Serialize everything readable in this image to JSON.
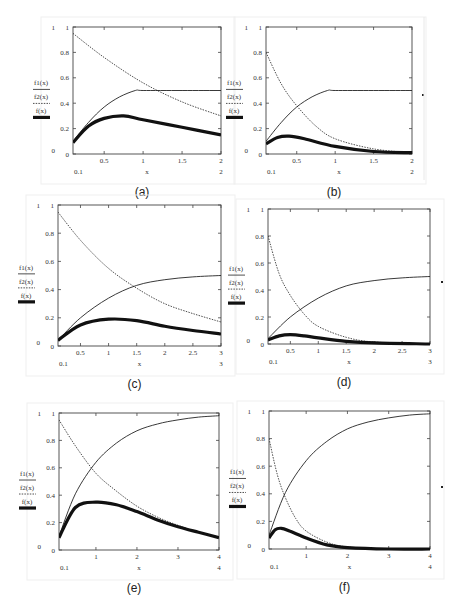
{
  "legend": {
    "f1": "f1(x)",
    "f2": "f2(x)",
    "f": "f(x)"
  },
  "panels": [
    {
      "id": "a",
      "caption": "(a)",
      "frame": [
        73,
        27,
        221,
        154
      ],
      "xmin": 0.1,
      "xmax": 2,
      "xticks": [
        0.5,
        1,
        1.5,
        2
      ],
      "xlabel": "x",
      "xmin_label": "0.1",
      "xmax_label": "2",
      "dot": null,
      "sep_x": null
    },
    {
      "id": "b",
      "caption": "(b)",
      "frame": [
        266,
        27,
        412,
        154
      ],
      "xmin": 0.1,
      "xmax": 2,
      "xticks": [
        0.5,
        1,
        1.5,
        2
      ],
      "xlabel": "x",
      "xmin_label": "0.1",
      "xmax_label": "2",
      "dot": [
        423,
        95
      ],
      "sep_x": 424
    },
    {
      "id": "c",
      "caption": "(c)",
      "frame": [
        58,
        205,
        221,
        346
      ],
      "xmin": 0.1,
      "xmax": 3,
      "xticks": [
        0.5,
        1,
        1.5,
        2,
        2.5,
        3
      ],
      "xlabel": "x",
      "xmin_label": "0.1",
      "xmax_label": "3",
      "dot": null,
      "sep_x": null
    },
    {
      "id": "d",
      "caption": "(d)",
      "frame": [
        268,
        209,
        430,
        344
      ],
      "xmin": 0.1,
      "xmax": 3,
      "xticks": [
        0.5,
        1,
        1.5,
        2,
        2.5,
        3
      ],
      "xlabel": "x",
      "xmin_label": "0.1",
      "xmax_label": "3",
      "dot": [
        442,
        282
      ],
      "sep_x": null
    },
    {
      "id": "e",
      "caption": "(e)",
      "frame": [
        59,
        413,
        219,
        550
      ],
      "xmin": 0.1,
      "xmax": 4,
      "xticks": [
        1,
        2,
        3,
        4
      ],
      "xlabel": "x",
      "xmin_label": "0.1",
      "xmax_label": "4",
      "dot": null,
      "sep_x": null
    },
    {
      "id": "f",
      "caption": "(f)",
      "frame": [
        269,
        411,
        430,
        549
      ],
      "xmin": 0.1,
      "xmax": 4,
      "xticks": [
        1,
        2,
        3,
        4
      ],
      "xlabel": "x",
      "xmin_label": "0.1",
      "xmax_label": "4",
      "dot": [
        442,
        487
      ],
      "sep_x": null
    }
  ],
  "chart_data": [
    {
      "panel": "a",
      "type": "line",
      "title": "(a)",
      "xlabel": "x",
      "ylabel": "",
      "xlim": [
        0.1,
        2
      ],
      "ylim": [
        0,
        1
      ],
      "yticks": [
        0,
        0.2,
        0.4,
        0.6,
        0.8,
        1
      ],
      "xticks": [
        0.5,
        1,
        1.5,
        2
      ],
      "legend": [
        "f1(x)",
        "f2(x)",
        "f(x)"
      ],
      "legend_position": "left",
      "series": [
        {
          "name": "f1(x)",
          "style": "solid-thin",
          "x": [
            0.1,
            0.3,
            0.5,
            0.7,
            0.9,
            1.0,
            1.5,
            2.0
          ],
          "y": [
            0.1,
            0.25,
            0.37,
            0.45,
            0.5,
            0.5,
            0.5,
            0.5
          ]
        },
        {
          "name": "f2(x)",
          "style": "dotted",
          "x": [
            0.1,
            0.5,
            1.0,
            1.5,
            2.0
          ],
          "y": [
            0.95,
            0.76,
            0.56,
            0.41,
            0.3
          ]
        },
        {
          "name": "f(x)",
          "style": "solid-thick",
          "x": [
            0.1,
            0.3,
            0.5,
            0.75,
            1.0,
            1.5,
            2.0
          ],
          "y": [
            0.09,
            0.22,
            0.28,
            0.3,
            0.27,
            0.21,
            0.15
          ]
        }
      ]
    },
    {
      "panel": "b",
      "type": "line",
      "title": "(b)",
      "xlabel": "x",
      "ylabel": "",
      "xlim": [
        0.1,
        2
      ],
      "ylim": [
        0,
        1
      ],
      "yticks": [
        0,
        0.2,
        0.4,
        0.6,
        0.8,
        1
      ],
      "xticks": [
        0.5,
        1,
        1.5,
        2
      ],
      "legend": [
        "f1(x)",
        "f2(x)",
        "f(x)"
      ],
      "legend_position": "left",
      "series": [
        {
          "name": "f1(x)",
          "style": "solid-thin",
          "x": [
            0.1,
            0.3,
            0.5,
            0.7,
            0.9,
            1.0,
            1.5,
            2.0
          ],
          "y": [
            0.1,
            0.25,
            0.37,
            0.45,
            0.5,
            0.5,
            0.5,
            0.5
          ]
        },
        {
          "name": "f2(x)",
          "style": "dotted",
          "x": [
            0.1,
            0.3,
            0.5,
            0.75,
            1.0,
            1.5,
            2.0
          ],
          "y": [
            0.8,
            0.55,
            0.38,
            0.22,
            0.12,
            0.04,
            0.01
          ]
        },
        {
          "name": "f(x)",
          "style": "solid-thick",
          "x": [
            0.1,
            0.25,
            0.4,
            0.6,
            1.0,
            1.5,
            2.0
          ],
          "y": [
            0.08,
            0.13,
            0.14,
            0.12,
            0.06,
            0.02,
            0.01
          ]
        }
      ]
    },
    {
      "panel": "c",
      "type": "line",
      "title": "(c)",
      "xlabel": "x",
      "ylabel": "",
      "xlim": [
        0.1,
        3
      ],
      "ylim": [
        0,
        1
      ],
      "yticks": [
        0,
        0.2,
        0.4,
        0.6,
        0.8,
        1
      ],
      "xticks": [
        0.5,
        1,
        1.5,
        2,
        2.5,
        3
      ],
      "legend": [
        "f1(x)",
        "f2(x)",
        "f(x)"
      ],
      "legend_position": "left",
      "series": [
        {
          "name": "f1(x)",
          "style": "solid-thin",
          "x": [
            0.1,
            0.5,
            1.0,
            1.5,
            2.0,
            2.5,
            3.0
          ],
          "y": [
            0.04,
            0.2,
            0.34,
            0.43,
            0.47,
            0.49,
            0.5
          ]
        },
        {
          "name": "f2(x)",
          "style": "dotted",
          "x": [
            0.1,
            0.5,
            1.0,
            1.5,
            2.0,
            2.5,
            3.0
          ],
          "y": [
            0.95,
            0.75,
            0.55,
            0.41,
            0.3,
            0.23,
            0.17
          ]
        },
        {
          "name": "f(x)",
          "style": "solid-thick",
          "x": [
            0.1,
            0.5,
            1.0,
            1.5,
            2.0,
            2.5,
            3.0
          ],
          "y": [
            0.04,
            0.15,
            0.19,
            0.18,
            0.14,
            0.11,
            0.085
          ]
        }
      ]
    },
    {
      "panel": "d",
      "type": "line",
      "title": "(d)",
      "xlabel": "x",
      "ylabel": "",
      "xlim": [
        0.1,
        3
      ],
      "ylim": [
        0,
        1
      ],
      "yticks": [
        0,
        0.2,
        0.4,
        0.6,
        0.8,
        1
      ],
      "xticks": [
        0.5,
        1,
        1.5,
        2,
        2.5,
        3
      ],
      "legend": [
        "f1(x)",
        "f2(x)",
        "f(x)"
      ],
      "legend_position": "left",
      "series": [
        {
          "name": "f1(x)",
          "style": "solid-thin",
          "x": [
            0.1,
            0.5,
            1.0,
            1.5,
            2.0,
            2.5,
            3.0
          ],
          "y": [
            0.04,
            0.2,
            0.34,
            0.43,
            0.47,
            0.49,
            0.5
          ]
        },
        {
          "name": "f2(x)",
          "style": "dotted",
          "x": [
            0.1,
            0.3,
            0.5,
            0.75,
            1.0,
            1.5,
            2.0,
            3.0
          ],
          "y": [
            0.8,
            0.52,
            0.36,
            0.22,
            0.13,
            0.05,
            0.015,
            0.0
          ]
        },
        {
          "name": "f(x)",
          "style": "solid-thick",
          "x": [
            0.1,
            0.3,
            0.5,
            0.75,
            1.0,
            1.5,
            2.0,
            3.0
          ],
          "y": [
            0.03,
            0.06,
            0.07,
            0.06,
            0.045,
            0.02,
            0.008,
            0.0
          ]
        }
      ]
    },
    {
      "panel": "e",
      "type": "line",
      "title": "(e)",
      "xlabel": "x",
      "ylabel": "",
      "xlim": [
        0.1,
        4
      ],
      "ylim": [
        0,
        1
      ],
      "yticks": [
        0,
        0.2,
        0.4,
        0.6,
        0.8,
        1
      ],
      "xticks": [
        1,
        2,
        3,
        4
      ],
      "legend": [
        "f1(x)",
        "f2(x)",
        "f(x)"
      ],
      "legend_position": "left",
      "series": [
        {
          "name": "f1(x)",
          "style": "solid-thin",
          "x": [
            0.1,
            0.5,
            1.0,
            1.5,
            2.0,
            2.5,
            3.0,
            3.5,
            4.0
          ],
          "y": [
            0.1,
            0.41,
            0.64,
            0.78,
            0.87,
            0.92,
            0.95,
            0.97,
            0.98
          ]
        },
        {
          "name": "f2(x)",
          "style": "dotted",
          "x": [
            0.1,
            0.5,
            1.0,
            1.5,
            2.0,
            2.5,
            3.0,
            3.5,
            4.0
          ],
          "y": [
            0.95,
            0.76,
            0.56,
            0.43,
            0.32,
            0.24,
            0.18,
            0.13,
            0.09
          ]
        },
        {
          "name": "f(x)",
          "style": "solid-thick",
          "x": [
            0.1,
            0.5,
            1.0,
            1.5,
            2.0,
            2.5,
            3.0,
            3.5,
            4.0
          ],
          "y": [
            0.09,
            0.31,
            0.35,
            0.33,
            0.28,
            0.22,
            0.17,
            0.13,
            0.09
          ]
        }
      ]
    },
    {
      "panel": "f",
      "type": "line",
      "title": "(f)",
      "xlabel": "x",
      "ylabel": "",
      "xlim": [
        0.1,
        4
      ],
      "ylim": [
        0,
        1
      ],
      "yticks": [
        0,
        0.2,
        0.4,
        0.6,
        0.8,
        1
      ],
      "xticks": [
        1,
        2,
        3,
        4
      ],
      "legend": [
        "f1(x)",
        "f2(x)",
        "f(x)"
      ],
      "legend_position": "left",
      "series": [
        {
          "name": "f1(x)",
          "style": "solid-thin",
          "x": [
            0.1,
            0.5,
            1.0,
            1.5,
            2.0,
            2.5,
            3.0,
            3.5,
            4.0
          ],
          "y": [
            0.1,
            0.41,
            0.64,
            0.78,
            0.87,
            0.92,
            0.95,
            0.97,
            0.98
          ]
        },
        {
          "name": "f2(x)",
          "style": "dotted",
          "x": [
            0.1,
            0.3,
            0.5,
            0.75,
            1.0,
            1.5,
            2.0,
            3.0,
            4.0
          ],
          "y": [
            0.8,
            0.54,
            0.37,
            0.22,
            0.13,
            0.05,
            0.015,
            0.0,
            0.0
          ]
        },
        {
          "name": "f(x)",
          "style": "solid-thick",
          "x": [
            0.1,
            0.25,
            0.4,
            0.6,
            1.0,
            1.5,
            2.0,
            3.0,
            4.0
          ],
          "y": [
            0.08,
            0.14,
            0.15,
            0.13,
            0.08,
            0.03,
            0.01,
            0.0,
            0.0
          ]
        }
      ]
    }
  ]
}
